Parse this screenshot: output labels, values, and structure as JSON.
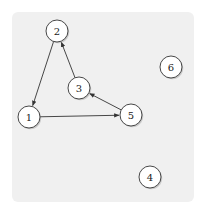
{
  "diagram": {
    "type": "directed-graph",
    "nodes": [
      {
        "id": "1",
        "label": "1",
        "x": 29,
        "y": 117
      },
      {
        "id": "2",
        "label": "2",
        "x": 57,
        "y": 31
      },
      {
        "id": "3",
        "label": "3",
        "x": 79,
        "y": 88
      },
      {
        "id": "4",
        "label": "4",
        "x": 150,
        "y": 177
      },
      {
        "id": "5",
        "label": "5",
        "x": 131,
        "y": 115
      },
      {
        "id": "6",
        "label": "6",
        "x": 171,
        "y": 67
      }
    ],
    "edges": [
      {
        "from": "2",
        "to": "1"
      },
      {
        "from": "1",
        "to": "5"
      },
      {
        "from": "5",
        "to": "3"
      },
      {
        "from": "3",
        "to": "2"
      }
    ],
    "colors": {
      "background": "#f0f0f0",
      "node_fill": "#ffffff",
      "stroke": "#333333"
    }
  }
}
